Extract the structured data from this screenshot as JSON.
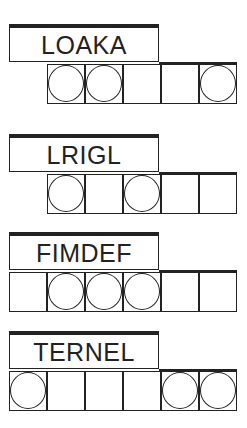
{
  "puzzles": [
    {
      "word": "LOAKA",
      "top": 24,
      "cells": [
        {
          "col": 1,
          "circle": true
        },
        {
          "col": 2,
          "circle": true
        },
        {
          "col": 3,
          "circle": false
        },
        {
          "col": 4,
          "circle": false
        },
        {
          "col": 5,
          "circle": true
        }
      ]
    },
    {
      "word": "LRIGL",
      "top": 134,
      "cells": [
        {
          "col": 1,
          "circle": true
        },
        {
          "col": 2,
          "circle": false
        },
        {
          "col": 3,
          "circle": true
        },
        {
          "col": 4,
          "circle": false
        },
        {
          "col": 5,
          "circle": false
        }
      ]
    },
    {
      "word": "FIMDEF",
      "top": 232,
      "cells": [
        {
          "col": 0,
          "circle": false
        },
        {
          "col": 1,
          "circle": true
        },
        {
          "col": 2,
          "circle": true
        },
        {
          "col": 3,
          "circle": true
        },
        {
          "col": 4,
          "circle": false
        },
        {
          "col": 5,
          "circle": false
        }
      ]
    },
    {
      "word": "TERNEL",
      "top": 331,
      "cells": [
        {
          "col": 0,
          "circle": true
        },
        {
          "col": 1,
          "circle": false
        },
        {
          "col": 2,
          "circle": false
        },
        {
          "col": 3,
          "circle": false
        },
        {
          "col": 4,
          "circle": true
        },
        {
          "col": 5,
          "circle": true
        }
      ]
    }
  ]
}
